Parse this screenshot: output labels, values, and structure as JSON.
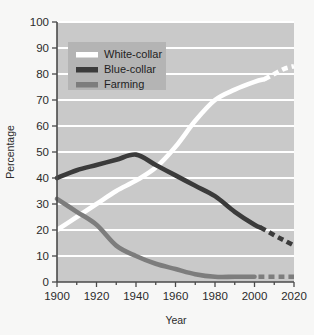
{
  "chart_data": {
    "type": "line",
    "title": "",
    "xlabel": "Year",
    "ylabel": "Percentage",
    "xlim": [
      1900,
      2020
    ],
    "ylim": [
      0,
      100
    ],
    "xticks": [
      1900,
      1920,
      1940,
      1960,
      1980,
      2000,
      2020
    ],
    "xtick_labels": [
      "1900",
      "1920",
      "1940",
      "1960",
      "1980",
      "2000",
      "2020"
    ],
    "xminor_ticks": [
      1910,
      1930,
      1950,
      1970,
      1990,
      2010
    ],
    "yticks": [
      0,
      10,
      20,
      30,
      40,
      50,
      60,
      70,
      80,
      90,
      100
    ],
    "ytick_labels": [
      "0",
      "10",
      "20",
      "30",
      "40",
      "50",
      "60",
      "70",
      "80",
      "90",
      "100"
    ],
    "grid": "horizontal-white",
    "legend_position": "upper-left-inside",
    "series": [
      {
        "name": "White-collar",
        "color": "#ffffff",
        "x": [
          1900,
          1910,
          1920,
          1930,
          1940,
          1950,
          1960,
          1970,
          1980,
          1990,
          2000,
          2005
        ],
        "values": [
          20,
          25,
          30,
          35,
          39,
          44,
          52,
          62,
          70,
          74,
          77,
          78
        ],
        "projected_x": [
          2005,
          2010,
          2015,
          2020
        ],
        "projected_values": [
          78,
          80,
          82,
          83
        ],
        "linestyle": "solid-then-dashed"
      },
      {
        "name": "Blue-collar",
        "color": "#3b3b3b",
        "x": [
          1900,
          1910,
          1920,
          1930,
          1940,
          1950,
          1960,
          1970,
          1980,
          1990,
          2000,
          2003
        ],
        "values": [
          40,
          43,
          45,
          47,
          49,
          45,
          41,
          37,
          33,
          27,
          22,
          21
        ],
        "projected_x": [
          2003,
          2010,
          2015,
          2020
        ],
        "projected_values": [
          21,
          18,
          16,
          14
        ],
        "linestyle": "solid-then-dashed"
      },
      {
        "name": "Farming",
        "color": "#7d7d7d",
        "x": [
          1900,
          1910,
          1920,
          1930,
          1940,
          1950,
          1960,
          1970,
          1980,
          1990,
          2000
        ],
        "values": [
          32,
          27,
          22,
          14,
          10,
          7,
          5,
          3,
          2,
          2,
          2
        ],
        "projected_x": [
          2002,
          2010,
          2015,
          2020
        ],
        "projected_values": [
          2,
          2,
          2,
          2
        ],
        "linestyle": "solid-then-dashed"
      }
    ]
  },
  "legend": {
    "items": [
      {
        "label": "White-collar",
        "color": "#ffffff"
      },
      {
        "label": "Blue-collar",
        "color": "#3b3b3b"
      },
      {
        "label": "Farming",
        "color": "#7d7d7d"
      }
    ]
  },
  "axes": {
    "y_axis_title": "Percentage",
    "x_axis_title": "Year"
  },
  "colors": {
    "figure_background": "#f7f7f6",
    "plot_background": "#c9c9c9",
    "gridline": "#ffffff",
    "axis_line": "#4a4a4a",
    "tick_label": "#2b2b2b",
    "legend_background": "#b4b4b4"
  }
}
